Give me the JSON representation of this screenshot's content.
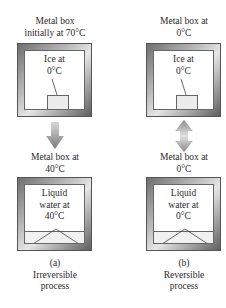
{
  "figure": {
    "left": {
      "top_caption_line1": "Metal box",
      "top_caption_line2": "initially at 70°C",
      "top_box_label_line1": "Ice at",
      "top_box_label_line2": "0°C",
      "arrow": "down-arrow",
      "bottom_caption_line1": "Metal box at",
      "bottom_caption_line2": "40°C",
      "bottom_box_label_line1": "Liquid",
      "bottom_box_label_line2": "water at",
      "bottom_box_label_line3": "40°C",
      "panel_letter": "(a)",
      "panel_title_line1": "Irreversible",
      "panel_title_line2": "process"
    },
    "right": {
      "top_caption_line1": "Metal box at",
      "top_caption_line2": "0°C",
      "top_box_label_line1": "Ice at",
      "top_box_label_line2": "0°C",
      "arrow": "double-headed-arrow",
      "bottom_caption_line1": "Metal box at",
      "bottom_caption_line2": "0°C",
      "bottom_box_label_line1": "Liquid",
      "bottom_box_label_line2": "water at",
      "bottom_box_label_line3": "0°C",
      "panel_letter": "(b)",
      "panel_title_line1": "Reversible",
      "panel_title_line2": "process"
    },
    "colors": {
      "frame_dark": "#5e5e5e",
      "frame_light": "#e6e6e6",
      "arrow": "#8c8c8c",
      "text": "#2a2a2a"
    }
  }
}
